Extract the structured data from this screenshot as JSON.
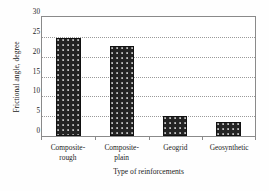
{
  "chart_data": {
    "type": "bar",
    "title": "",
    "categories": [
      "Composite-rough",
      "Composite-plain",
      "Geogrid",
      "Geosynthetic"
    ],
    "category_lines": [
      [
        "Composite-",
        "rough"
      ],
      [
        "Composite-",
        "plain"
      ],
      [
        "Geogrid",
        ""
      ],
      [
        "Geosynthetic",
        ""
      ]
    ],
    "values": [
      24.7,
      22.7,
      4.9,
      3.5
    ],
    "xlabel": "Type of reinforcements",
    "ylabel": "Frictional angle, degree",
    "ylim": [
      0,
      30
    ],
    "ytick_labels": [
      "0",
      "5",
      "10",
      "15",
      "20",
      "25",
      "30"
    ],
    "ytick_values": [
      0,
      5,
      10,
      15,
      20,
      25,
      30
    ],
    "grid": "horizontal-dotted",
    "legend": "none",
    "bar_color": "#232323",
    "bar_pattern": "dotted-texture",
    "grid_color": "#9a9a9a",
    "axis_color": "#8a8a8a",
    "background": "#ffffff"
  }
}
